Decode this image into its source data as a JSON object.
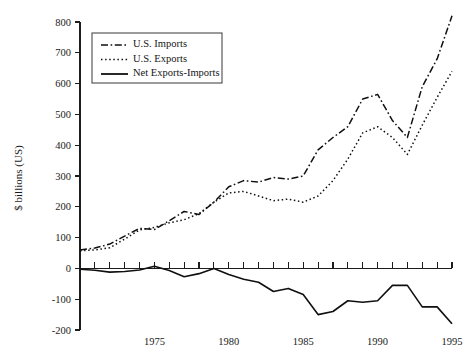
{
  "chart_data": {
    "type": "line",
    "title": "",
    "xlabel": "",
    "ylabel": "$ billions (US)",
    "xlim": [
      1970,
      1995
    ],
    "ylim": [
      -200,
      800
    ],
    "grid": false,
    "legend_position": "top-left",
    "x": [
      1970,
      1971,
      1972,
      1973,
      1974,
      1975,
      1976,
      1977,
      1978,
      1979,
      1980,
      1981,
      1982,
      1983,
      1984,
      1985,
      1986,
      1987,
      1988,
      1989,
      1990,
      1991,
      1992,
      1993,
      1994,
      1995
    ],
    "x_ticks": [
      1970,
      1971,
      1972,
      1973,
      1974,
      1975,
      1976,
      1977,
      1978,
      1979,
      1980,
      1981,
      1982,
      1983,
      1984,
      1985,
      1986,
      1987,
      1988,
      1989,
      1990,
      1991,
      1992,
      1993,
      1994,
      1995
    ],
    "x_tick_labels": [
      "1975",
      "1980",
      "1985",
      "1990",
      "1995"
    ],
    "x_tick_label_values": [
      1975,
      1980,
      1985,
      1990,
      1995
    ],
    "y_ticks": [
      -200,
      -100,
      0,
      100,
      200,
      300,
      400,
      500,
      600,
      700,
      800
    ],
    "y_tick_labels": [
      "-200",
      "-100",
      "0",
      "100",
      "200",
      "300",
      "400",
      "500",
      "600",
      "700",
      "800"
    ],
    "series": [
      {
        "name": "U.S. Imports",
        "style": "dash-dot",
        "values": [
          60,
          66,
          79,
          105,
          130,
          126,
          155,
          185,
          175,
          215,
          265,
          285,
          280,
          295,
          290,
          300,
          385,
          425,
          460,
          550,
          565,
          480,
          425,
          590,
          680,
          820
        ]
      },
      {
        "name": "U.S. Exports",
        "style": "dotted",
        "values": [
          57,
          60,
          67,
          95,
          125,
          133,
          148,
          158,
          178,
          215,
          245,
          250,
          235,
          220,
          225,
          215,
          235,
          285,
          355,
          440,
          460,
          425,
          370,
          465,
          555,
          640
        ]
      },
      {
        "name": "Net Exports-Imports",
        "style": "solid",
        "values": [
          -3,
          -6,
          -12,
          -10,
          -5,
          7,
          -7,
          -27,
          -17,
          0,
          -20,
          -35,
          -45,
          -75,
          -65,
          -85,
          -150,
          -140,
          -105,
          -110,
          -105,
          -55,
          -55,
          -125,
          -125,
          -180
        ]
      }
    ],
    "legend": [
      {
        "label": "U.S. Imports",
        "style": "dash-dot"
      },
      {
        "label": "U.S. Exports",
        "style": "dotted"
      },
      {
        "label": "Net Exports-Imports",
        "style": "solid"
      }
    ]
  }
}
